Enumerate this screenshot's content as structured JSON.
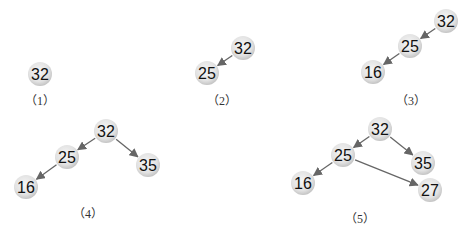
{
  "colors": {
    "node_fill_center": "#f4f4f4",
    "node_fill_edge": "#c8c8c8",
    "edge": "#666666",
    "text": "#111111",
    "background": "#ffffff"
  },
  "node_radius": 12,
  "steps": [
    {
      "label": "（1）",
      "label_pos": [
        40,
        101
      ],
      "nodes": [
        {
          "id": "n32",
          "value": "32",
          "x": 40,
          "y": 74
        }
      ],
      "edges": []
    },
    {
      "label": "（2）",
      "label_pos": [
        222,
        101
      ],
      "nodes": [
        {
          "id": "n32",
          "value": "32",
          "x": 243,
          "y": 48
        },
        {
          "id": "n25",
          "value": "25",
          "x": 207,
          "y": 73
        }
      ],
      "edges": [
        {
          "from": "n32",
          "to": "n25"
        }
      ]
    },
    {
      "label": "（3）",
      "label_pos": [
        411,
        101
      ],
      "nodes": [
        {
          "id": "n32",
          "value": "32",
          "x": 446,
          "y": 21
        },
        {
          "id": "n25",
          "value": "25",
          "x": 410,
          "y": 46
        },
        {
          "id": "n16",
          "value": "16",
          "x": 373,
          "y": 72
        }
      ],
      "edges": [
        {
          "from": "n32",
          "to": "n25"
        },
        {
          "from": "n25",
          "to": "n16"
        }
      ]
    },
    {
      "label": "（4）",
      "label_pos": [
        88,
        214
      ],
      "nodes": [
        {
          "id": "n32",
          "value": "32",
          "x": 106,
          "y": 131
        },
        {
          "id": "n25",
          "value": "25",
          "x": 67,
          "y": 157
        },
        {
          "id": "n35",
          "value": "35",
          "x": 148,
          "y": 165
        },
        {
          "id": "n16",
          "value": "16",
          "x": 26,
          "y": 187
        }
      ],
      "edges": [
        {
          "from": "n32",
          "to": "n25"
        },
        {
          "from": "n32",
          "to": "n35"
        },
        {
          "from": "n25",
          "to": "n16"
        }
      ]
    },
    {
      "label": "（5）",
      "label_pos": [
        360,
        219
      ],
      "nodes": [
        {
          "id": "n32",
          "value": "32",
          "x": 380,
          "y": 129
        },
        {
          "id": "n25",
          "value": "25",
          "x": 343,
          "y": 155
        },
        {
          "id": "n35",
          "value": "35",
          "x": 423,
          "y": 163
        },
        {
          "id": "n16",
          "value": "16",
          "x": 303,
          "y": 183
        },
        {
          "id": "n27",
          "value": "27",
          "x": 430,
          "y": 190
        }
      ],
      "edges": [
        {
          "from": "n32",
          "to": "n25"
        },
        {
          "from": "n32",
          "to": "n35"
        },
        {
          "from": "n25",
          "to": "n16"
        },
        {
          "from": "n25",
          "to": "n27"
        }
      ]
    }
  ]
}
